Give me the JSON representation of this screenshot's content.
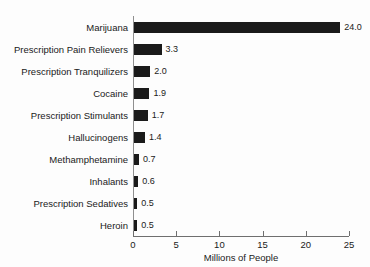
{
  "chart_data": {
    "type": "bar",
    "orientation": "horizontal",
    "title": "",
    "subtitle": "",
    "xlabel": "Millions of People",
    "ylabel": "",
    "xlim": [
      0,
      25
    ],
    "xticks": [
      0,
      5,
      10,
      15,
      20,
      25
    ],
    "xtick_labels": [
      "0",
      "5",
      "10",
      "15",
      "20",
      "25"
    ],
    "grid": false,
    "legend": null,
    "bar_color": "#1a1a1a",
    "categories": [
      "Marijuana",
      "Prescription Pain Relievers",
      "Prescription Tranquilizers",
      "Cocaine",
      "Prescription Stimulants",
      "Hallucinogens",
      "Methamphetamine",
      "Inhalants",
      "Prescription Sedatives",
      "Heroin"
    ],
    "values": [
      24.0,
      3.3,
      2.0,
      1.9,
      1.7,
      1.4,
      0.7,
      0.6,
      0.5,
      0.5
    ],
    "value_labels": [
      "24.0",
      "3.3",
      "2.0",
      "1.9",
      "1.7",
      "1.4",
      "0.7",
      "0.6",
      "0.5",
      "0.5"
    ],
    "bars": [
      {
        "category": "Marijuana",
        "value": 24.0,
        "label": "24.0"
      },
      {
        "category": "Prescription Pain Relievers",
        "value": 3.3,
        "label": "3.3"
      },
      {
        "category": "Prescription Tranquilizers",
        "value": 2.0,
        "label": "2.0"
      },
      {
        "category": "Cocaine",
        "value": 1.9,
        "label": "1.9"
      },
      {
        "category": "Prescription Stimulants",
        "value": 1.7,
        "label": "1.7"
      },
      {
        "category": "Hallucinogens",
        "value": 1.4,
        "label": "1.4"
      },
      {
        "category": "Methamphetamine",
        "value": 0.7,
        "label": "0.7"
      },
      {
        "category": "Inhalants",
        "value": 0.6,
        "label": "0.6"
      },
      {
        "category": "Prescription Sedatives",
        "value": 0.5,
        "label": "0.5"
      },
      {
        "category": "Heroin",
        "value": 0.5,
        "label": "0.5"
      }
    ]
  }
}
